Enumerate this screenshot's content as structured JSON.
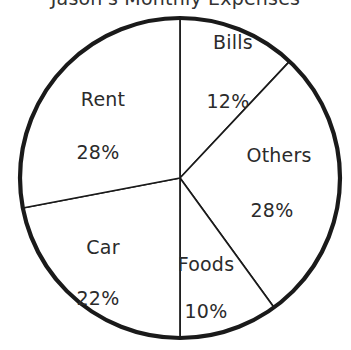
{
  "title": "Jason's Monthly Expenses",
  "chart_data": {
    "type": "pie",
    "title": "Jason's Monthly Expenses",
    "xlabel": "",
    "ylabel": "",
    "legend": "none",
    "grid": false,
    "start_angle_deg": 90,
    "direction": "clockwise",
    "categories": [
      "Bills",
      "Others",
      "Foods",
      "Car",
      "Rent"
    ],
    "values": [
      12,
      28,
      10,
      22,
      28
    ],
    "value_suffix": "%",
    "total": 100,
    "slices": [
      {
        "name": "Bills",
        "label": "Bills",
        "value": 12,
        "value_label": "12%",
        "color": "#ffffff",
        "outline": "#1a1a1a",
        "label_x": 233,
        "label_y": 42,
        "value_x": 228,
        "value_y": 101
      },
      {
        "name": "Others",
        "label": "Others",
        "value": 28,
        "value_label": "28%",
        "color": "#ffffff",
        "outline": "#1a1a1a",
        "label_x": 279,
        "label_y": 155,
        "value_x": 272,
        "value_y": 210
      },
      {
        "name": "Foods",
        "label": "Foods",
        "value": 10,
        "value_label": "10%",
        "color": "#ffffff",
        "outline": "#1a1a1a",
        "label_x": 206,
        "label_y": 264,
        "value_x": 206,
        "value_y": 311
      },
      {
        "name": "Car",
        "label": "Car",
        "value": 22,
        "value_label": "22%",
        "color": "#ffffff",
        "outline": "#1a1a1a",
        "label_x": 103,
        "label_y": 247,
        "value_x": 98,
        "value_y": 298
      },
      {
        "name": "Rent",
        "label": "Rent",
        "value": 28,
        "value_label": "28%",
        "color": "#ffffff",
        "outline": "#1a1a1a",
        "label_x": 103,
        "label_y": 99,
        "value_x": 98,
        "value_y": 152
      }
    ],
    "geometry": {
      "center_x": 180,
      "center_y": 178,
      "radius": 160
    }
  }
}
